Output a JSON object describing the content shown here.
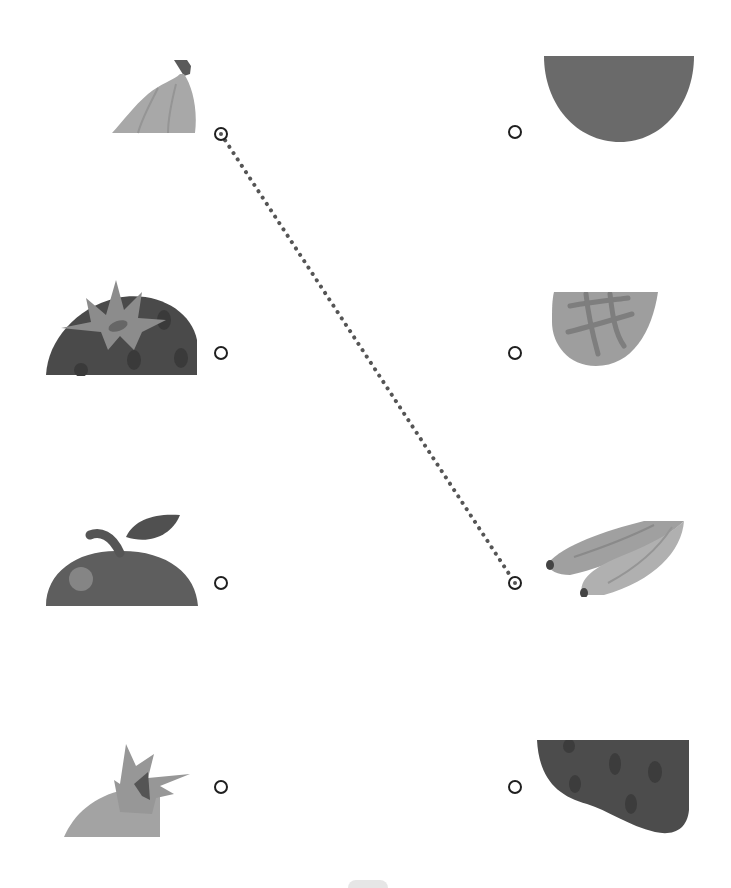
{
  "game": {
    "type": "match-fruit-halves",
    "left_items": [
      {
        "id": "L1",
        "label": "banana top half",
        "color": "#a8a8a8"
      },
      {
        "id": "L2",
        "label": "strawberry left half",
        "color": "#4a4a4a"
      },
      {
        "id": "L3",
        "label": "apple top half",
        "color": "#5e5e5e"
      },
      {
        "id": "L4",
        "label": "pineapple left half",
        "color": "#a3a3a3"
      }
    ],
    "right_items": [
      {
        "id": "R1",
        "label": "watermelon bottom half",
        "color": "#6a6a6a"
      },
      {
        "id": "R2",
        "label": "mango half",
        "color": "#9e9e9e"
      },
      {
        "id": "R3",
        "label": "banana bottom half",
        "color": "#a6a6a6"
      },
      {
        "id": "R4",
        "label": "strawberry right half",
        "color": "#4c4c4c"
      }
    ],
    "connections": [
      {
        "from": "L1",
        "to": "R3",
        "style": "dotted"
      }
    ],
    "colors": {
      "dot_border": "#1f1f1f",
      "line": "#555555",
      "background": "#ffffff"
    }
  }
}
